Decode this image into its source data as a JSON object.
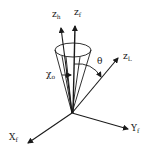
{
  "diagram": {
    "axes": [
      {
        "id": "z_h",
        "base": "z",
        "sub": "h"
      },
      {
        "id": "z_f",
        "base": "z",
        "sub": "f"
      },
      {
        "id": "z_L",
        "base": "z",
        "sub": "L"
      },
      {
        "id": "y_f",
        "base": "Y",
        "sub": "f"
      },
      {
        "id": "x_f",
        "base": "X",
        "sub": "f"
      }
    ],
    "angles": {
      "theta": "θ",
      "chi_base": "χ",
      "chi_sub": "o"
    },
    "colors": {
      "ink": "#1a1a1a",
      "background": "#ffffff"
    }
  }
}
